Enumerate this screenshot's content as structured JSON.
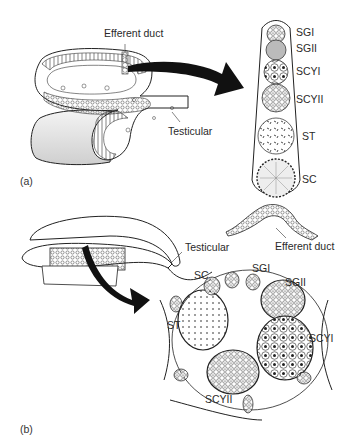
{
  "panel_a": {
    "panel_label": "(a)",
    "left_labels": {
      "efferent_duct": "Efferent duct",
      "testicular": "Testicular"
    },
    "cyst_column_labels": [
      "SGI",
      "SGII",
      "SCYI",
      "SCYII",
      "ST",
      "SC"
    ],
    "duct_label": "Efferent duct"
  },
  "panel_b": {
    "panel_label": "(b)",
    "testicular_label": "Testicular",
    "cyst_labels": {
      "sc": "SC",
      "sgi": "SGI",
      "sgii": "SGII",
      "st": "ST",
      "scyi": "SCYI",
      "scyii": "SCYII"
    }
  },
  "colors": {
    "ink": "#1a1a1a",
    "background": "#ffffff",
    "shade": "#d9d9d9"
  }
}
